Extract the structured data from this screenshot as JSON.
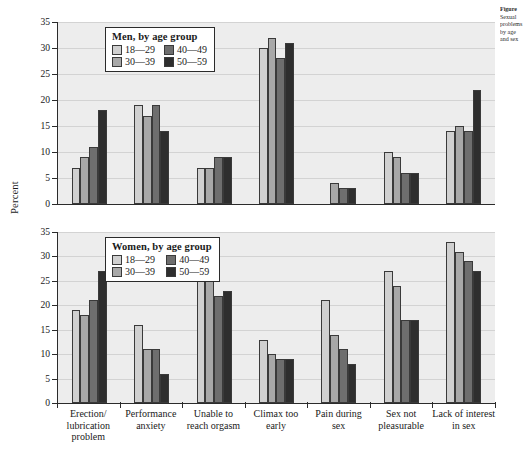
{
  "figure": {
    "ylabel": "Percent"
  },
  "axis": {
    "yticks": [
      0,
      5,
      10,
      15,
      20,
      25,
      30,
      35
    ],
    "ymin": 0,
    "ymax": 35
  },
  "categories": [
    "Erection/\nlubrication\nproblem",
    "Performance\nanxiety",
    "Unable to\nreach orgasm",
    "Climax too\nearly",
    "Pain during\nsex",
    "Sex not\npleasurable",
    "Lack of interest\nin sex"
  ],
  "series_names": [
    "18—29",
    "30—39",
    "40—49",
    "50—59"
  ],
  "series_colors": [
    "#d0d0d0",
    "#a8a8a8",
    "#6e6e6e",
    "#2e2e2e"
  ],
  "panels": [
    {
      "legend_title": "Men, by age group",
      "legend_order": [
        "18—29",
        "40—49",
        "30—39",
        "50—59"
      ]
    },
    {
      "legend_title": "Women, by age group",
      "legend_order": [
        "18—29",
        "40—49",
        "30—39",
        "50—59"
      ]
    }
  ],
  "side_note": {
    "line1": "Figure",
    "line2": "Sexual",
    "line3": "problems",
    "line4": "by age",
    "line5": "and sex"
  },
  "chart_data": [
    {
      "type": "bar",
      "title": "Men, by age group",
      "xlabel": "",
      "ylabel": "Percent",
      "ylim": [
        0,
        35
      ],
      "grid": true,
      "legend_position": "inside-top-left",
      "categories": [
        "Erection/lubrication problem",
        "Performance anxiety",
        "Unable to reach orgasm",
        "Climax too early",
        "Pain during sex",
        "Sex not pleasurable",
        "Lack of interest in sex"
      ],
      "series": [
        {
          "name": "18—29",
          "values": [
            7,
            19,
            7,
            30,
            0,
            10,
            14
          ]
        },
        {
          "name": "30—39",
          "values": [
            9,
            17,
            7,
            32,
            4,
            9,
            15
          ]
        },
        {
          "name": "40—49",
          "values": [
            11,
            19,
            9,
            28,
            3,
            6,
            14
          ]
        },
        {
          "name": "50—59",
          "values": [
            18,
            14,
            9,
            31,
            3,
            6,
            22
          ]
        }
      ]
    },
    {
      "type": "bar",
      "title": "Women, by age group",
      "xlabel": "",
      "ylabel": "Percent",
      "ylim": [
        0,
        35
      ],
      "grid": true,
      "legend_position": "inside-top-left",
      "categories": [
        "Erection/lubrication problem",
        "Performance anxiety",
        "Unable to reach orgasm",
        "Climax too early",
        "Pain during sex",
        "Sex not pleasurable",
        "Lack of interest in sex"
      ],
      "series": [
        {
          "name": "18—29",
          "values": [
            19,
            16,
            28,
            13,
            21,
            27,
            33
          ]
        },
        {
          "name": "30—39",
          "values": [
            18,
            11,
            26,
            10,
            14,
            24,
            31
          ]
        },
        {
          "name": "40—49",
          "values": [
            21,
            11,
            22,
            9,
            11,
            17,
            29
          ]
        },
        {
          "name": "50—59",
          "values": [
            27,
            6,
            23,
            9,
            8,
            17,
            27
          ]
        }
      ]
    }
  ]
}
